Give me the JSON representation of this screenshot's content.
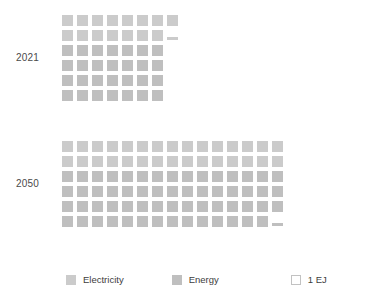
{
  "chart_data": {
    "type": "bar",
    "chart_style": "waffle-pictogram",
    "title": "",
    "subtitle": "",
    "xlabel": "",
    "ylabel": "",
    "unit": "EJ",
    "unit_per_square": 1,
    "grid": false,
    "legend_position": "bottom",
    "categories": [
      "2021",
      "2050"
    ],
    "series": [
      {
        "name": "Electricity",
        "color": "#cbcbcb",
        "values": [
          15.2,
          30.0
        ]
      },
      {
        "name": "Energy",
        "color": "#bfbfbf",
        "values": [
          35.0,
          59.2
        ]
      }
    ],
    "totals": [
      50.2,
      89.2
    ],
    "legend": [
      {
        "label": "Electricity",
        "swatch": "filled",
        "color": "#cbcbcb"
      },
      {
        "label": "Energy",
        "swatch": "filled",
        "color": "#bfbfbf"
      },
      {
        "label": "1 EJ",
        "swatch": "outline",
        "color": "#ffffff"
      }
    ],
    "groups": [
      {
        "category": "2021",
        "rows": [
          {
            "series": "Electricity",
            "full": 8,
            "partial": 0
          },
          {
            "series": "Electricity",
            "full": 7,
            "partial": 0.2
          },
          {
            "series": "Energy",
            "full": 7,
            "partial": 0
          },
          {
            "series": "Energy",
            "full": 7,
            "partial": 0
          },
          {
            "series": "Energy",
            "full": 7,
            "partial": 0
          },
          {
            "series": "Energy",
            "full": 7,
            "partial": 0
          }
        ]
      },
      {
        "category": "2050",
        "rows": [
          {
            "series": "Electricity",
            "full": 15,
            "partial": 0
          },
          {
            "series": "Electricity",
            "full": 15,
            "partial": 0
          },
          {
            "series": "Energy",
            "full": 15,
            "partial": 0
          },
          {
            "series": "Energy",
            "full": 15,
            "partial": 0
          },
          {
            "series": "Energy",
            "full": 15,
            "partial": 0
          },
          {
            "series": "Energy",
            "full": 14,
            "partial": 0.2
          }
        ]
      }
    ]
  },
  "groups": {
    "y2021": {
      "label": "2021"
    },
    "y2050": {
      "label": "2050"
    }
  },
  "legend": {
    "electricity": {
      "label": "Electricity"
    },
    "energy": {
      "label": "Energy"
    },
    "unit": {
      "label": "1 EJ"
    }
  }
}
